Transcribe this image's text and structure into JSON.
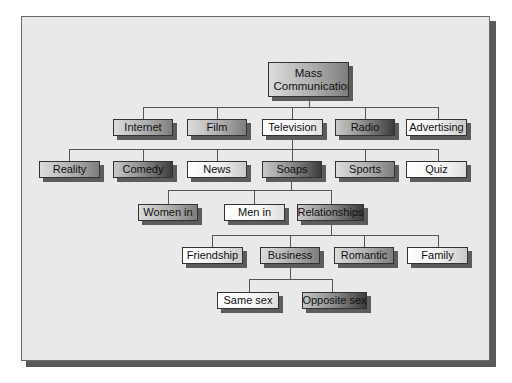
{
  "diagram": {
    "root": {
      "label": "Mass Communication"
    },
    "level1": [
      {
        "label": "Internet"
      },
      {
        "label": "Film"
      },
      {
        "label": "Television"
      },
      {
        "label": "Radio"
      },
      {
        "label": "Advertising"
      }
    ],
    "level2": [
      {
        "label": "Reality"
      },
      {
        "label": "Comedy"
      },
      {
        "label": "News"
      },
      {
        "label": "Soaps"
      },
      {
        "label": "Sports"
      },
      {
        "label": "Quiz"
      }
    ],
    "level3": [
      {
        "label": "Women in"
      },
      {
        "label": "Men in"
      },
      {
        "label": "Relationships"
      }
    ],
    "level4": [
      {
        "label": "Friendship"
      },
      {
        "label": "Business"
      },
      {
        "label": "Romantic"
      },
      {
        "label": "Family"
      }
    ],
    "level5": [
      {
        "label": "Same sex"
      },
      {
        "label": "Opposite sex"
      }
    ],
    "edges": [
      [
        "Mass Communication",
        "Internet"
      ],
      [
        "Mass Communication",
        "Film"
      ],
      [
        "Mass Communication",
        "Television"
      ],
      [
        "Mass Communication",
        "Radio"
      ],
      [
        "Mass Communication",
        "Advertising"
      ],
      [
        "Television",
        "Reality"
      ],
      [
        "Television",
        "Comedy"
      ],
      [
        "Television",
        "News"
      ],
      [
        "Television",
        "Soaps"
      ],
      [
        "Television",
        "Sports"
      ],
      [
        "Television",
        "Quiz"
      ],
      [
        "Soaps",
        "Women in"
      ],
      [
        "Soaps",
        "Men in"
      ],
      [
        "Soaps",
        "Relationships"
      ],
      [
        "Relationships",
        "Friendship"
      ],
      [
        "Relationships",
        "Business"
      ],
      [
        "Relationships",
        "Romantic"
      ],
      [
        "Relationships",
        "Family"
      ],
      [
        "Business",
        "Same sex"
      ],
      [
        "Business",
        "Opposite sex"
      ]
    ]
  }
}
